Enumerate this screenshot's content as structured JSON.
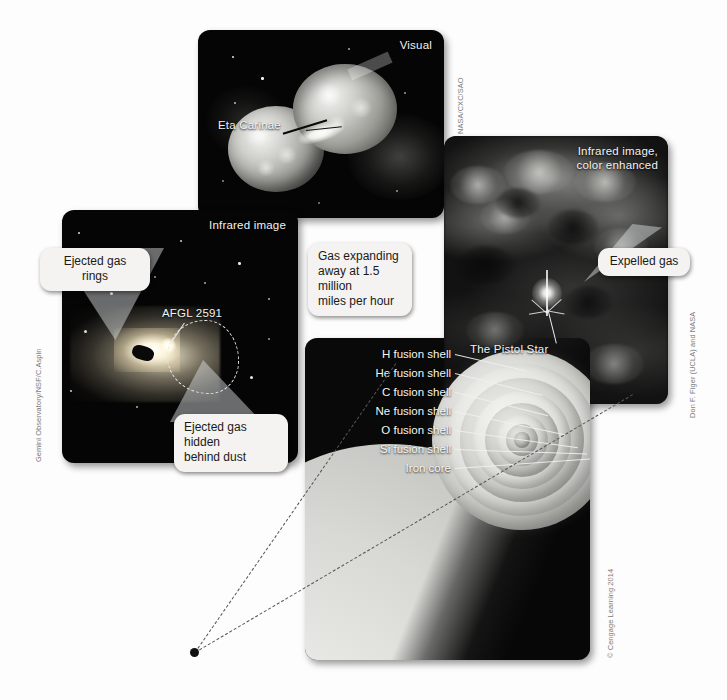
{
  "figure": {
    "background_color": "#fdfdfd"
  },
  "panels": {
    "visual": {
      "label": "Visual",
      "object_label": "Eta Carinae",
      "credit": "NASA/CXC/SAO",
      "callout": "Gas expanding\naway at 1.5 million\nmiles per hour"
    },
    "infrared_afgl": {
      "label": "Infrared image",
      "object_label": "AFGL 2591",
      "credit": "Gemini Observatory/NSF/C.Aspin",
      "callout_top": "Ejected gas rings",
      "callout_bottom": "Ejected gas hidden\nbehind dust"
    },
    "pistol": {
      "label": "Infrared image,\ncolor enhanced",
      "object_label": "The Pistol Star",
      "credit": "Don F. Figer (UCLA) and NASA",
      "callout": "Expelled gas"
    },
    "onion": {
      "credit": "© Cengage Learning 2014",
      "shell_labels": [
        "H fusion shell",
        "He fusion shell",
        "C fusion shell",
        "Ne fusion shell",
        "O fusion shell",
        "Si fusion shell",
        "Iron core"
      ]
    }
  },
  "colors": {
    "panel_background": "#050505",
    "callout_background": "#f4f3f1",
    "callout_text": "#1a1a1a",
    "label_text": "#f2f2f2",
    "credit_text": "#7b7b7b",
    "wedge_fill": "rgba(225,228,232,0.46)",
    "dashed_line": "#555555",
    "star_surface_light": "#f2f2f0"
  }
}
